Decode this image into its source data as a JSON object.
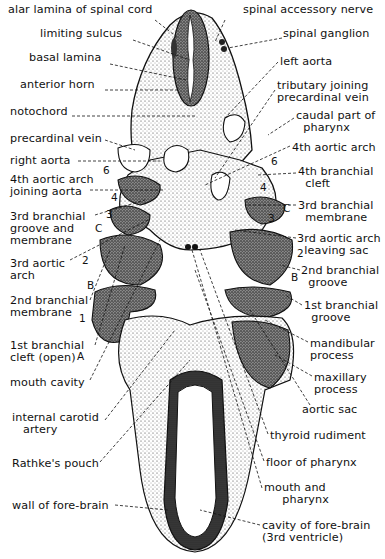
{
  "figure": {
    "title": "",
    "labels_left": [
      {
        "id": "alar-lamina",
        "text": "alar lamina of spinal cord",
        "x": 8,
        "y": 10
      },
      {
        "id": "limiting-sulcus",
        "text": "limiting sulcus",
        "x": 40,
        "y": 33
      },
      {
        "id": "basal-lamina",
        "text": "basal lamina",
        "x": 29,
        "y": 57
      },
      {
        "id": "anterior-horn",
        "text": "anterior horn",
        "x": 20,
        "y": 84
      },
      {
        "id": "notochord",
        "text": "notochord",
        "x": 10,
        "y": 111
      },
      {
        "id": "precardinal-vein",
        "text": "precardinal vein",
        "x": 10,
        "y": 136
      },
      {
        "id": "right-aorta",
        "text": "right aorta",
        "x": 10,
        "y": 156
      },
      {
        "id": "4th-aortic-arch-joining-aorta",
        "text": "4th aortic arch\njoining aorta",
        "x": 10,
        "y": 173
      },
      {
        "id": "3rd-branchial-groove",
        "text": "3rd branchial\ngroove and\nmembrane",
        "x": 10,
        "y": 211
      },
      {
        "id": "3rd-aortic-arch",
        "text": "3rd aortic\narch",
        "x": 10,
        "y": 257
      },
      {
        "id": "2nd-branchial-membrane",
        "text": "2nd branchial\nmembrane",
        "x": 10,
        "y": 292
      },
      {
        "id": "1st-branchial-cleft",
        "text": "1st branchial\ncleft (open)",
        "x": 10,
        "y": 338
      },
      {
        "id": "mouth-cavity",
        "text": "mouth cavity",
        "x": 10,
        "y": 374
      },
      {
        "id": "internal-carotid-artery",
        "text": "internal carotid\n   artery",
        "x": 12,
        "y": 404
      },
      {
        "id": "rathkes-pouch",
        "text": "Rathke's pouch",
        "x": 12,
        "y": 455
      },
      {
        "id": "wall-of-fore-brain",
        "text": "wall of fore-brain",
        "x": 12,
        "y": 500
      }
    ],
    "labels_right": [
      {
        "id": "spinal-accessory-nerve",
        "text": "spinal accessory nerve",
        "x": 243,
        "y": 8
      },
      {
        "id": "spinal-ganglion",
        "text": "spinal ganglion",
        "x": 283,
        "y": 30
      },
      {
        "id": "left-aorta",
        "text": "left aorta",
        "x": 280,
        "y": 57
      },
      {
        "id": "tributary-joining-precardinal-vein",
        "text": "tributary joining\nprecardinal vein",
        "x": 277,
        "y": 80
      },
      {
        "id": "caudal-part-of-pharynx",
        "text": "caudal part of\n  pharynx",
        "x": 296,
        "y": 110
      },
      {
        "id": "4th-aortic-arch",
        "text": "4th aortic arch",
        "x": 292,
        "y": 141
      },
      {
        "id": "4th-branchial-cleft",
        "text": "4th branchial\n  cleft",
        "x": 298,
        "y": 166
      },
      {
        "id": "3rd-branchial-membrane",
        "text": "3rd branchial\n  membrane",
        "x": 298,
        "y": 200
      },
      {
        "id": "3rd-aortic-arch-leaving-sac",
        "text": "3rd aortic arch\n  leaving sac",
        "x": 297,
        "y": 233
      },
      {
        "id": "2nd-branchial-groove",
        "text": "2nd branchial\n  groove",
        "x": 301,
        "y": 265
      },
      {
        "id": "1st-branchial-groove",
        "text": "1st branchial\n  groove",
        "x": 304,
        "y": 300
      },
      {
        "id": "mandibular-process",
        "text": "mandibular\nprocess",
        "x": 310,
        "y": 338
      },
      {
        "id": "maxillary-process",
        "text": "maxillary\nprocess",
        "x": 314,
        "y": 372
      },
      {
        "id": "aortic-sac",
        "text": "aortic sac",
        "x": 302,
        "y": 404
      },
      {
        "id": "thyroid-rudiment",
        "text": "thyroid rudiment",
        "x": 270,
        "y": 429
      },
      {
        "id": "floor-of-pharynx",
        "text": "floor of pharynx",
        "x": 266,
        "y": 456
      },
      {
        "id": "mouth-and-pharynx",
        "text": "mouth and\n     pharynx",
        "x": 264,
        "y": 482
      },
      {
        "id": "cavity-of-fore-brain",
        "text": "cavity of fore-brain\n(3rd ventricle)",
        "x": 262,
        "y": 520
      }
    ],
    "arch_numbers_left": [
      {
        "text": "6",
        "x": 103,
        "y": 170
      },
      {
        "text": "4",
        "x": 111,
        "y": 196
      },
      {
        "text": "3",
        "x": 106,
        "y": 213
      },
      {
        "text": "C",
        "x": 95,
        "y": 227
      },
      {
        "text": "2",
        "x": 82,
        "y": 259
      },
      {
        "text": "B",
        "x": 87,
        "y": 284
      },
      {
        "text": "1",
        "x": 79,
        "y": 317
      },
      {
        "text": "A",
        "x": 77,
        "y": 355
      }
    ],
    "arch_numbers_right": [
      {
        "text": "6",
        "x": 271,
        "y": 160
      },
      {
        "text": "4",
        "x": 260,
        "y": 186
      },
      {
        "text": "C",
        "x": 276,
        "y": 207
      },
      {
        "text": "3",
        "x": 266,
        "y": 213
      },
      {
        "text": "2",
        "x": 298,
        "y": 251
      },
      {
        "text": "B",
        "x": 291,
        "y": 275
      }
    ],
    "colors": {
      "ink": "#111111",
      "stipple": "#2a2a2a",
      "paper": "#ffffff",
      "dark_tissue": "#3a3a3a"
    }
  }
}
